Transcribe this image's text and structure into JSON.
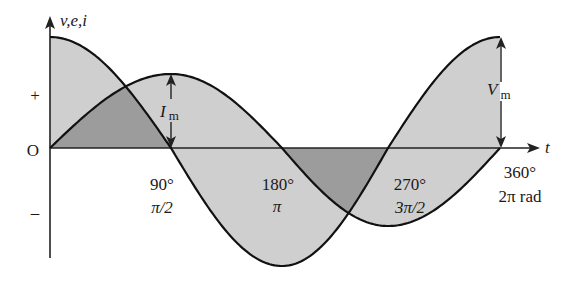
{
  "figure": {
    "y_axis_label": "v,e,i",
    "x_axis_label": "t",
    "origin_label": "O",
    "plus_label": "+",
    "minus_label": "–",
    "ticks": [
      {
        "deg": "90°",
        "rad": "π/2"
      },
      {
        "deg": "180°",
        "rad": "π"
      },
      {
        "deg": "270°",
        "rad": "3π/2"
      },
      {
        "deg": "360°",
        "rad": "2π rad"
      }
    ],
    "current_amplitude_label": {
      "main": "I",
      "sub": "m"
    },
    "voltage_amplitude_label": {
      "main": "V",
      "sub": "m"
    }
  },
  "waveforms": {
    "angles_deg": [
      0,
      90,
      180,
      270,
      360
    ],
    "x_px": [
      50,
      171,
      282,
      388,
      500
    ],
    "axis_y_px": 148,
    "voltage": {
      "function": "cos",
      "amp_pos_px": 111,
      "amp_neg_px": 118,
      "description": "voltage leads current by 90°"
    },
    "current": {
      "function": "sin",
      "amp_pos_px": 74,
      "amp_neg_px": 78
    }
  },
  "colors": {
    "light_fill": "#cfcfcf",
    "overlap_fill": "#9c9c9c",
    "stroke": "#111111"
  }
}
